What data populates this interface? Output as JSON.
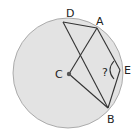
{
  "diagram": {
    "circle": {
      "cx": 68,
      "cy": 73,
      "r": 55,
      "fill": "#e3e3e3",
      "stroke": "#9a9a9a"
    },
    "center_dot_color": "#555555",
    "line_color": "#333333",
    "points": {
      "D": {
        "x": 63,
        "y": 22,
        "label": "D",
        "lx": 66,
        "ly": 16
      },
      "A": {
        "x": 97,
        "y": 28,
        "label": "A",
        "lx": 96,
        "ly": 25
      },
      "E": {
        "x": 120,
        "y": 70,
        "label": "E",
        "lx": 124,
        "ly": 74
      },
      "C": {
        "x": 69,
        "y": 74,
        "label": "C",
        "lx": 55,
        "ly": 78
      },
      "B": {
        "x": 108,
        "y": 108,
        "label": "B",
        "lx": 108,
        "ly": 122
      }
    },
    "segments": [
      "D-A",
      "D-B",
      "A-C",
      "C-B",
      "A-E",
      "E-B"
    ],
    "angle_marker": {
      "vertex": "E",
      "label": "?",
      "lx": 103,
      "ly": 75
    }
  }
}
